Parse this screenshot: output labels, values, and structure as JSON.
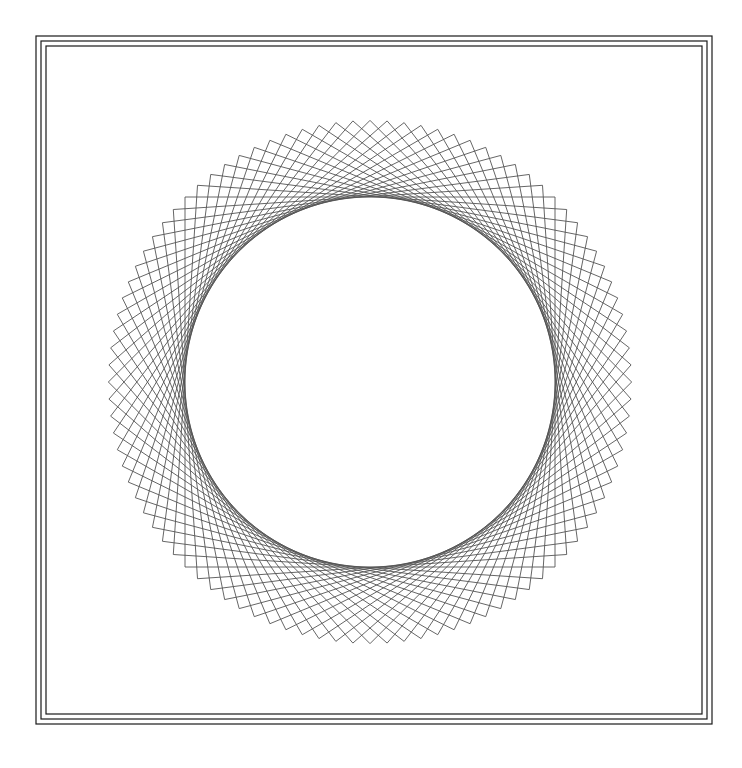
{
  "document": {
    "title": "Rotating Squares Geometric Pattern",
    "background_color": "#ffffff",
    "width": 742,
    "height": 768
  },
  "frame": {
    "name": "triple-line-border",
    "description": "Three concentric thin rectangular rules forming a decorative page border",
    "stroke_color": "#1a1a1a",
    "stroke_width": 1.2,
    "rects": [
      {
        "x": 36,
        "y": 36,
        "width": 676,
        "height": 688
      },
      {
        "x": 41,
        "y": 41,
        "width": 666,
        "height": 678
      },
      {
        "x": 46,
        "y": 46,
        "width": 656,
        "height": 668
      }
    ]
  },
  "pattern": {
    "name": "rotating-square-rosette",
    "center_x": 370,
    "center_y": 382,
    "half_side": 185,
    "square_count": 24,
    "rotation_step_degrees": 3.75,
    "total_rotation_degrees": 90,
    "stroke_color": "#555555",
    "stroke_width": 0.9,
    "fill": "none",
    "envelope_inner_radius": 185,
    "envelope_outer_radius": 261.6
  },
  "chart_data": {
    "type": "line",
    "xlabel": "",
    "ylabel": "",
    "grid": false,
    "legend": "none",
    "center": [
      370,
      382
    ],
    "square_half_side": 185,
    "series": [
      {
        "name": "square-rotation-angles-degrees",
        "values": [
          0,
          3.75,
          7.5,
          11.25,
          15,
          18.75,
          22.5,
          26.25,
          30,
          33.75,
          37.5,
          41.25,
          45,
          48.75,
          52.5,
          56.25,
          60,
          63.75,
          67.5,
          71.25,
          75,
          78.75,
          82.5,
          86.25
        ]
      }
    ],
    "envelope_circle": {
      "cx": 370,
      "cy": 382,
      "r": 185
    },
    "outer_vertex_radius": 261.6,
    "xlim": [
      108,
      632
    ],
    "ylim": [
      120,
      644
    ]
  }
}
